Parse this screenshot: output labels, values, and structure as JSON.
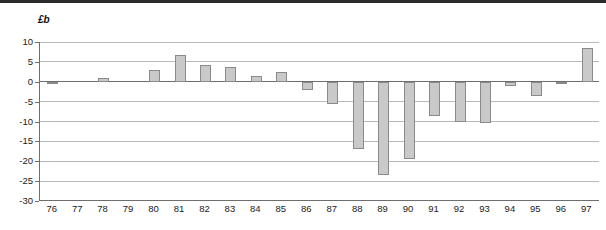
{
  "figure": {
    "unit_label": "£b"
  },
  "chart_data": {
    "type": "bar",
    "title": "",
    "subtitle": "",
    "xlabel": "",
    "ylabel": "£b",
    "categories": [
      "76",
      "77",
      "78",
      "79",
      "80",
      "81",
      "82",
      "83",
      "84",
      "85",
      "86",
      "87",
      "88",
      "89",
      "90",
      "91",
      "92",
      "93",
      "94",
      "95",
      "96",
      "97"
    ],
    "values": [
      -0.6,
      0,
      1.0,
      0,
      3.0,
      6.8,
      4.2,
      3.6,
      1.4,
      2.5,
      -2.0,
      -5.5,
      -17.0,
      -23.5,
      -19.5,
      -8.5,
      -10.0,
      -10.5,
      -1.0,
      -3.5,
      -0.3,
      8.5
    ],
    "ylim": [
      -30,
      10
    ],
    "yticks": [
      10,
      5,
      0,
      -5,
      -10,
      -15,
      -20,
      -25,
      -30
    ],
    "ytick_labels": [
      "10",
      "5",
      "0",
      "-5",
      "-10",
      "-15",
      "-20",
      "-25",
      "-30"
    ],
    "grid": true,
    "legend": "none",
    "bar_color": "#c9c9c9",
    "bar_edge_color": "#8a8a8a",
    "grid_color": "#b9b9b9",
    "axis_color": "#6e6e6e"
  }
}
